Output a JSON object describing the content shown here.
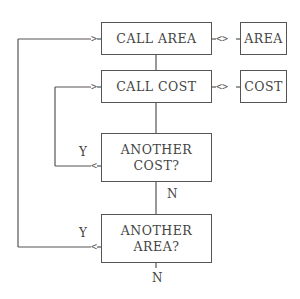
{
  "diagram": {
    "type": "flowchart",
    "nodes": [
      {
        "id": "call_area",
        "label": "CALL AREA",
        "kind": "process"
      },
      {
        "id": "call_cost",
        "label": "CALL COST",
        "kind": "process"
      },
      {
        "id": "another_cost",
        "label": "ANOTHER\nCOST?",
        "kind": "decision"
      },
      {
        "id": "another_area",
        "label": "ANOTHER\nAREA?",
        "kind": "decision"
      },
      {
        "id": "area",
        "label": "AREA",
        "kind": "subroutine"
      },
      {
        "id": "cost",
        "label": "COST",
        "kind": "subroutine"
      }
    ],
    "edges": [
      {
        "from": "call_area",
        "to": "area",
        "label": "",
        "style": "<>"
      },
      {
        "from": "call_cost",
        "to": "cost",
        "label": "",
        "style": "<>"
      },
      {
        "from": "call_area",
        "to": "call_cost",
        "label": ""
      },
      {
        "from": "call_cost",
        "to": "another_cost",
        "label": ""
      },
      {
        "from": "another_cost",
        "to": "call_cost",
        "label": "Y"
      },
      {
        "from": "another_cost",
        "to": "another_area",
        "label": "N"
      },
      {
        "from": "another_area",
        "to": "call_area",
        "label": "Y"
      },
      {
        "from": "another_area",
        "to": "exit",
        "label": "N"
      }
    ],
    "labels": {
      "cost_yes": "Y",
      "cost_no": "N",
      "area_yes": "Y",
      "area_no": "N"
    },
    "connectors": {
      "entry_arrow": ">",
      "return_arrow": "<",
      "bidirectional": "<>"
    },
    "colors": {
      "line": "#555555",
      "text": "#444444",
      "background": "#ffffff"
    }
  }
}
